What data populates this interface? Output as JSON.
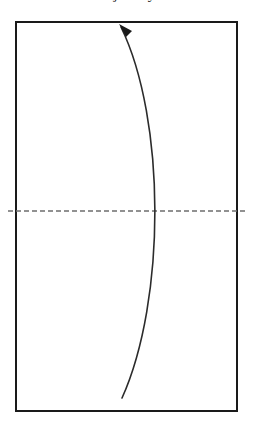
{
  "figure": {
    "background_color": "#ffffff",
    "cropped_caption_fragment": "trajectory",
    "boundary_box": {
      "name": "rectangular-boundary",
      "x": 16,
      "y": 22,
      "width": 221,
      "height": 389,
      "stroke_color": "#1a1a1a",
      "stroke_width": 2,
      "fill": "none"
    },
    "midline": {
      "name": "horizontal-dashed-midline",
      "y": 211,
      "x_start": 8,
      "x_end": 246,
      "stroke_color": "#6e6e6e",
      "stroke_width": 1.4,
      "dash_pattern": "5 3"
    },
    "curve": {
      "name": "curved-trajectory-arc",
      "stroke_color": "#2b2b2b",
      "stroke_width": 1.6,
      "fill": "none",
      "start_point": [
        122,
        398
      ],
      "end_point": [
        121,
        27
      ],
      "control_point_1": [
        166,
        300
      ],
      "control_point_2": [
        166,
        120
      ],
      "rightmost_x": 166,
      "direction": "upward",
      "bow": "right"
    },
    "arrowhead": {
      "name": "arrowhead-marker",
      "tip": [
        119,
        24
      ],
      "points": "119,24 132,31 126,37",
      "fill_color": "#1a1a1a",
      "direction": "up-left"
    }
  }
}
